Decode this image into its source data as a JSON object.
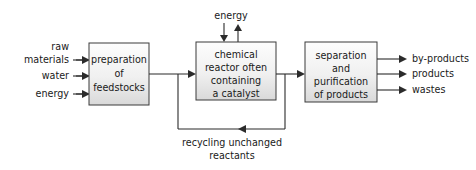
{
  "diagram": {
    "background_color": "#ffffff",
    "line_color": "#2b2b2b",
    "box_stroke_color": "#3a3a3a",
    "box_fill_top": "#fdfdfd",
    "box_fill_bottom": "#d9d9d9",
    "text_color": "#1a1a1a"
  },
  "boxes": {
    "preparation": {
      "lines": [
        "preparation",
        "of",
        "feedstocks"
      ],
      "line1": "preparation",
      "line2": "of",
      "line3": "feedstocks"
    },
    "reactor": {
      "lines": [
        "chemical",
        "reactor often",
        "containing",
        "a catalyst"
      ],
      "line1": "chemical",
      "line2": "reactor often",
      "line3": "containing",
      "line4": "a catalyst"
    },
    "separation": {
      "lines": [
        "separation",
        "and",
        "purification",
        "of products"
      ],
      "line1": "separation",
      "line2": "and",
      "line3": "purification",
      "line4": "of products"
    }
  },
  "inputs": {
    "raw_materials_line1": "raw",
    "raw_materials_line2": "materials",
    "water": "water",
    "energy": "energy"
  },
  "outputs": {
    "by_products": "by-products",
    "products": "products",
    "wastes": "wastes"
  },
  "energy_input": {
    "label": "energy"
  },
  "recycle": {
    "line1": "recycling unchanged",
    "line2": "reactants"
  }
}
